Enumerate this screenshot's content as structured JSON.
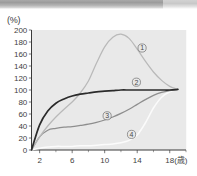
{
  "figure": {
    "y_unit_label": "(%)",
    "x_unit_label": "(歳)"
  },
  "chart_data": {
    "type": "line",
    "title": "",
    "subtitle": "",
    "xlabel": "(歳)",
    "ylabel": "(%)",
    "xlim": [
      1,
      20
    ],
    "ylim": [
      0,
      200
    ],
    "xticks": [
      2,
      6,
      10,
      14,
      18
    ],
    "xtick_labels": [
      "2",
      "6",
      "10",
      "14",
      "18"
    ],
    "xminorticks": [
      4,
      8,
      12,
      16,
      20
    ],
    "yticks": [
      0,
      20,
      40,
      60,
      80,
      100,
      120,
      140,
      160,
      180,
      200
    ],
    "ytick_labels": [
      "0",
      "20",
      "40",
      "60",
      "80",
      "100",
      "120",
      "140",
      "160",
      "180",
      "200"
    ],
    "grid": false,
    "legend": "inline-callouts",
    "plot_background": "#e8e8e8",
    "series": [
      {
        "name": "1",
        "marker_label": "①",
        "color": "#b9b9b9",
        "label_x": 14.6,
        "label_y": 170,
        "x": [
          1,
          2,
          3,
          4,
          5,
          6,
          7,
          8,
          9,
          10,
          11,
          12,
          13,
          14,
          15,
          16,
          17,
          18,
          19
        ],
        "y": [
          0,
          22,
          40,
          55,
          68,
          80,
          95,
          115,
          145,
          172,
          188,
          193,
          186,
          168,
          148,
          130,
          116,
          106,
          101
        ]
      },
      {
        "name": "2",
        "marker_label": "②",
        "color": "#2b2b2b",
        "label_x": 13.9,
        "label_y": 113,
        "x": [
          1,
          2,
          3,
          4,
          5,
          6,
          7,
          8,
          9,
          10,
          11,
          12,
          13,
          14,
          15,
          16,
          17,
          18,
          19
        ],
        "y": [
          0,
          42,
          65,
          78,
          85,
          90,
          93,
          95,
          97,
          98,
          99,
          100,
          100,
          100,
          100,
          100,
          100,
          100,
          101
        ]
      },
      {
        "name": "3",
        "marker_label": "③",
        "color": "#8e8e8e",
        "label_x": 10.3,
        "label_y": 57,
        "x": [
          1,
          2,
          3,
          4,
          5,
          6,
          7,
          8,
          9,
          10,
          11,
          12,
          13,
          14,
          15,
          16,
          17,
          18,
          19
        ],
        "y": [
          0,
          22,
          33,
          36,
          38,
          39,
          41,
          43,
          46,
          50,
          55,
          61,
          68,
          76,
          84,
          91,
          96,
          99,
          101
        ]
      },
      {
        "name": "4",
        "marker_label": "④",
        "color": "#fbfbfb",
        "label_x": 13.3,
        "label_y": 26,
        "x": [
          1,
          2,
          3,
          4,
          5,
          6,
          7,
          8,
          9,
          10,
          11,
          12,
          13,
          14,
          15,
          16,
          17,
          18,
          19
        ],
        "y": [
          0,
          3,
          5,
          6,
          6,
          6,
          7,
          7,
          8,
          9,
          10,
          12,
          16,
          25,
          45,
          70,
          88,
          97,
          101
        ]
      }
    ]
  }
}
